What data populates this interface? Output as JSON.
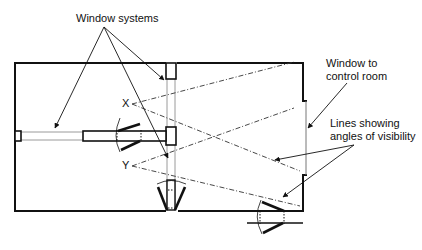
{
  "labels": {
    "window_systems": "Window systems",
    "window_to_control_room_line1": "Window to",
    "window_to_control_room_line2": "control room",
    "lines_visibility_line1": "Lines showing",
    "lines_visibility_line2": "angles of visibility",
    "marker_x": "X",
    "marker_y": "Y"
  },
  "colors": {
    "wall": "#111111",
    "window_line": "#9a9a9a",
    "text": "#111111"
  }
}
